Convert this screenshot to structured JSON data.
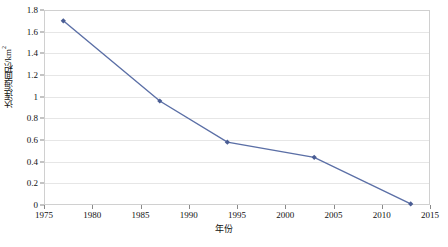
{
  "chart_data": {
    "type": "line",
    "title": "",
    "xlabel": "年份",
    "ylabel": "达连海面积/km²",
    "ylabel_base": "达连海面积/km",
    "ylabel_sup": "2",
    "xlim": [
      1975,
      2015
    ],
    "ylim": [
      0,
      1.8
    ],
    "grid": true,
    "legend": "none",
    "series_color": "#5b6fa6",
    "marker": "diamond",
    "x": [
      1977,
      1987,
      1994,
      2003,
      2013
    ],
    "values": [
      1.7,
      0.96,
      0.58,
      0.44,
      0.01
    ],
    "points": [
      {
        "x": 1977,
        "y": 1.7
      },
      {
        "x": 1987,
        "y": 0.96
      },
      {
        "x": 1994,
        "y": 0.58
      },
      {
        "x": 2003,
        "y": 0.44
      },
      {
        "x": 2013,
        "y": 0.01
      }
    ],
    "xticks": [
      1975,
      1980,
      1985,
      1990,
      1995,
      2000,
      2005,
      2010,
      2015
    ],
    "xtick_labels": [
      "1975",
      "1980",
      "1985",
      "1990",
      "1995",
      "2000",
      "2005",
      "2010",
      "2015"
    ],
    "yticks": [
      0,
      0.2,
      0.4,
      0.6,
      0.8,
      1,
      1.2,
      1.4,
      1.6,
      1.8
    ],
    "ytick_labels": [
      "0",
      "0.2",
      "0.4",
      "0.6",
      "0.8",
      "1",
      "1.2",
      "1.4",
      "1.6",
      "1.8"
    ],
    "colors": {
      "line": "#5b6fa6",
      "marker": "#4a5d94",
      "grid": "#e6e6e6",
      "frame": "#d0d0d0",
      "axis": "#8a8a8a",
      "text": "#111111",
      "background": "#ffffff"
    }
  }
}
